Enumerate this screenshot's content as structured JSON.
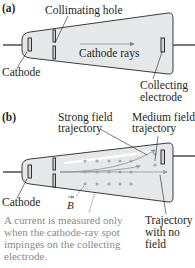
{
  "panel_a": {
    "tag": "(a)",
    "labels": {
      "collimating_hole": "Collimating hole",
      "cathode_rays": "Cathode rays",
      "cathode": "Cathode",
      "collecting_1": "Collecting",
      "collecting_2": "electrode"
    }
  },
  "panel_b": {
    "tag": "(b)",
    "labels": {
      "strong_1": "Strong field",
      "strong_2": "trajectory",
      "medium_1": "Medium field",
      "medium_2": "trajectory",
      "cathode": "Cathode",
      "b_field": "B",
      "nofield_1": "Trajectory",
      "nofield_2": "with no",
      "nofield_3": "field",
      "note_1": "A current is measured only",
      "note_2": "when the cathode-ray spot",
      "note_3": "impinges on the collecting",
      "note_4": "electrode."
    }
  },
  "colors": {
    "tube_fill": "#e6e7e8",
    "tube_stroke": "#3c3c3c",
    "dot": "#a7a9ac",
    "trajectory": "#9a9a9a",
    "note_text": "#8a8a8a"
  }
}
